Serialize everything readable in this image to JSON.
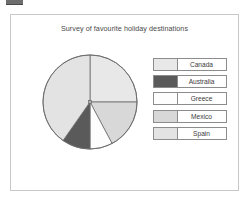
{
  "frame": {
    "title": "Survey of favourite holiday destinations"
  },
  "legend": {
    "items": [
      {
        "label": "Canada",
        "color": "#e8e8e8"
      },
      {
        "label": "Australia",
        "color": "#5a5a5a"
      },
      {
        "label": "Greece",
        "color": "#fdfdfd"
      },
      {
        "label": "Mexico",
        "color": "#d8d8d8"
      },
      {
        "label": "Spain",
        "color": "#e3e3e3"
      }
    ]
  },
  "chart_data": {
    "type": "pie",
    "title": "Survey of favourite holiday destinations",
    "xlabel": "",
    "ylabel": "",
    "legend_position": "right",
    "grid": false,
    "start_angle_deg": 0,
    "direction": "clockwise",
    "categories": [
      "Canada",
      "Mexico",
      "Greece",
      "Australia",
      "Spain"
    ],
    "values": [
      25,
      17,
      8,
      10,
      40
    ],
    "unit": "percent",
    "slices": [
      {
        "label": "Canada",
        "percent": 25,
        "start_deg": 0,
        "end_deg": 90,
        "color": "#e8e8e8"
      },
      {
        "label": "Mexico",
        "percent": 17,
        "start_deg": 90,
        "end_deg": 152,
        "color": "#d8d8d8"
      },
      {
        "label": "Greece",
        "percent": 8,
        "start_deg": 152,
        "end_deg": 180,
        "color": "#fdfdfd"
      },
      {
        "label": "Australia",
        "percent": 10,
        "start_deg": 180,
        "end_deg": 215,
        "color": "#5a5a5a"
      },
      {
        "label": "Spain",
        "percent": 40,
        "start_deg": 215,
        "end_deg": 360,
        "color": "#e3e3e3"
      }
    ]
  }
}
